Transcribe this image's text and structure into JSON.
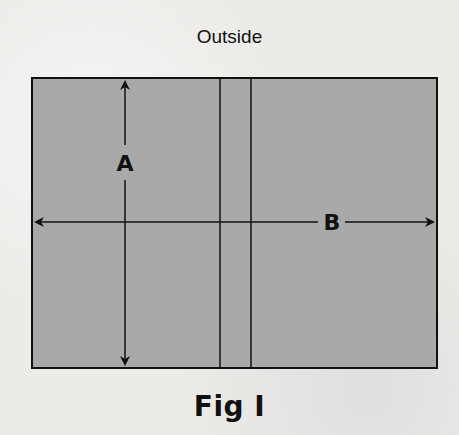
{
  "diagram": {
    "title": "Outside",
    "caption": "Fig I",
    "panel_fill": "#a9a9a9",
    "line_color": "#111111",
    "dimension_labels": {
      "vertical": "A",
      "horizontal": "B"
    }
  }
}
